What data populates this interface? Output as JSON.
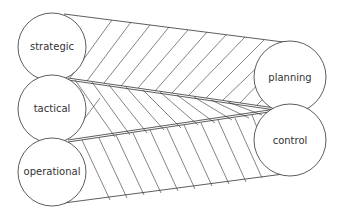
{
  "diagram": {
    "left_nodes": [
      {
        "id": "strategic",
        "label": "strategic"
      },
      {
        "id": "tactical",
        "label": "tactical"
      },
      {
        "id": "operational",
        "label": "operational"
      }
    ],
    "right_nodes": [
      {
        "id": "planning",
        "label": "planning"
      },
      {
        "id": "control",
        "label": "control"
      }
    ],
    "colors": {
      "stroke": "#333333",
      "background": "#ffffff"
    }
  }
}
